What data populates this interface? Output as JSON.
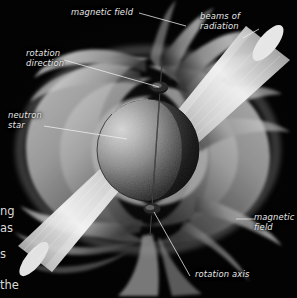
{
  "figure": {
    "background_color": "#030303",
    "label_color": "#e8e8e8",
    "leader_line_color": "#f2f2f2",
    "star_color_lit": "#cfcfcf",
    "star_color_dark": "#0a0a0a",
    "field_color": "#b9b9b9",
    "beam_color": "#dcdcdc"
  },
  "labels": {
    "magnetic_field_top": "magnetic field",
    "beams_of_radiation": "beams of\nradiation",
    "rotation_direction": "rotation\ndirection",
    "neutron_star": "neutron\nstar",
    "magnetic_field_right": "magnetic\nfield",
    "rotation_axis": "rotation axis"
  },
  "margin_text_fragments": {
    "frag1": "ng",
    "frag2": "as",
    "frag3": "s",
    "frag4": "the"
  }
}
